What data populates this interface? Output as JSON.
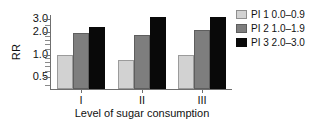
{
  "chart_data": {
    "type": "bar",
    "title": "",
    "xlabel": "Level of sugar consumption",
    "ylabel": "RR",
    "categories": [
      "I",
      "II",
      "III"
    ],
    "yscale": "log",
    "ylim": [
      0.35,
      3.4
    ],
    "yticks": [
      0.5,
      1.0,
      2.0,
      3.0
    ],
    "ytick_labels": [
      "0.5",
      "1.0",
      "2.0",
      "3.0"
    ],
    "grid": false,
    "legend_position": "right",
    "series": [
      {
        "name": "PI 1 0.0–0.9",
        "color": "#d2d2d2",
        "values": [
          1.0,
          0.85,
          1.0
        ]
      },
      {
        "name": "PI 2 1.0–1.9",
        "color": "#7e7e7e",
        "values": [
          1.95,
          1.85,
          2.15
        ]
      },
      {
        "name": "PI 3 2.0–3.0",
        "color": "#090909",
        "values": [
          2.35,
          3.2,
          3.2
        ]
      }
    ]
  },
  "legend": {
    "items": [
      {
        "label": "PI 1 0.0–0.9",
        "swatch": "pi1"
      },
      {
        "label": "PI 2 1.0–1.9",
        "swatch": "pi2"
      },
      {
        "label": "PI 3 2.0–3.0",
        "swatch": "pi3"
      }
    ]
  },
  "axes": {
    "y_title": "RR",
    "x_title": "Level of sugar consumption",
    "y_tick_labels": [
      "3.0",
      "2.0",
      "1.0",
      "0.5"
    ],
    "x_tick_labels": [
      "I",
      "II",
      "III"
    ]
  }
}
